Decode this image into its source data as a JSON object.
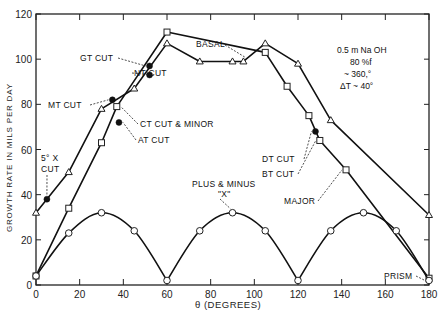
{
  "chart_data": {
    "type": "line",
    "title": "",
    "xlabel": "θ (DEGREES)",
    "ylabel": "GROWTH RATE IN MILS PER DAY",
    "xlim": [
      0,
      180
    ],
    "ylim": [
      0,
      120
    ],
    "xticks": [
      0,
      20,
      40,
      60,
      80,
      100,
      120,
      140,
      160,
      180
    ],
    "yticks": [
      0,
      20,
      40,
      60,
      80,
      100,
      120
    ],
    "grid": false,
    "conditions": [
      "0.5 m Na OH",
      "80 %f",
      "~ 360,°",
      "ΔT ~ 40°"
    ],
    "series": [
      {
        "name": "triangle-series",
        "marker": "triangle",
        "x": [
          0,
          15,
          30,
          45,
          60,
          75,
          90,
          95,
          105,
          120,
          135,
          180
        ],
        "y": [
          32,
          50,
          78,
          87,
          107,
          99,
          99,
          99,
          107,
          98,
          73,
          31
        ]
      },
      {
        "name": "square-series",
        "marker": "square",
        "x": [
          0,
          15,
          30,
          37,
          60,
          105,
          115,
          125,
          130,
          142,
          180
        ],
        "y": [
          4,
          34,
          63,
          79,
          112,
          103,
          88,
          75,
          64,
          51,
          3
        ]
      },
      {
        "name": "circle-series (plus & minus X)",
        "marker": "circle",
        "x": [
          0,
          15,
          30,
          45,
          60,
          75,
          90,
          105,
          120,
          135,
          150,
          165,
          180
        ],
        "y": [
          4,
          23,
          32,
          24,
          2,
          24,
          32,
          24,
          2,
          24,
          32,
          24,
          2
        ]
      }
    ],
    "cut_points": [
      {
        "label": "5° X CUT",
        "x": 5,
        "y": 38
      },
      {
        "label": "MT CUT",
        "x": 35,
        "y": 82
      },
      {
        "label": "AT CUT",
        "x": 38,
        "y": 72
      },
      {
        "label": "GT CUT",
        "x": 52,
        "y": 97
      },
      {
        "label": "NT CUT",
        "x": 52,
        "y": 93
      },
      {
        "label": "DT CUT",
        "x": 128,
        "y": 68
      }
    ],
    "annotations": [
      {
        "label": "CT CUT & MINOR",
        "x": 37,
        "y": 79
      },
      {
        "label": "BASAL",
        "x": 95,
        "y": 99
      },
      {
        "label": "BT CUT",
        "x": 130,
        "y": 64
      },
      {
        "label": "MAJOR",
        "x": 142,
        "y": 51
      },
      {
        "label": "PLUS & MINUS \"X\"",
        "x": 90,
        "y": 32
      },
      {
        "label": "PRISM",
        "x": 180,
        "y": 2
      }
    ]
  },
  "labels": {
    "gt": "GT CUT",
    "nt": "NT CUT",
    "mt": "MT CUT",
    "ct": "CT CUT & MINOR",
    "at": "AT CUT",
    "x5a": "5° X",
    "x5b": "CUT",
    "basal": "BASAL",
    "dt": "DT CUT",
    "bt": "BT CUT",
    "major": "MAJOR",
    "plusminus": "PLUS & MINUS",
    "xq": "\"X\"",
    "prism": "PRISM",
    "cond1": "0.5 m Na OH",
    "cond2": "80 %f",
    "cond3": "~ 360,°",
    "cond4": "ΔT ~ 40°",
    "ylabel": "GROWTH RATE IN MILS PER DAY",
    "xlabel": "θ (DEGREES)"
  }
}
